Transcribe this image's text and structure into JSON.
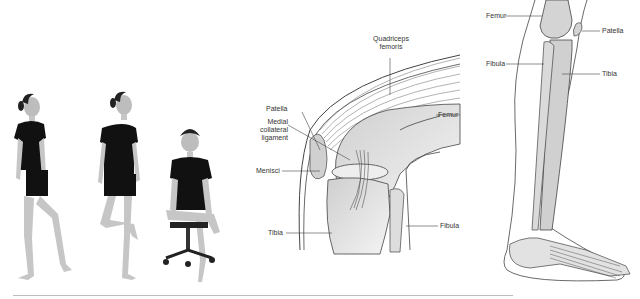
{
  "figure": {
    "panels": [
      {
        "id": "exercise-photos",
        "description": "Three photos of a girl performing knee-flexion positions",
        "poses": [
          "standing-leg-raised-forward",
          "standing-knee-bent-back",
          "seated-on-chair-leg-crossed"
        ]
      },
      {
        "id": "knee-anatomy",
        "labels": {
          "quadriceps": "Quadriceps\nfemoris",
          "quadriceps_line1": "Quadriceps",
          "quadriceps_line2": "femoris",
          "patella": "Patella",
          "medial_line1": "Medial",
          "medial_line2": "collateral",
          "medial_line3": "ligament",
          "femur": "Femur",
          "menisci": "Menisci",
          "tibia": "Tibia",
          "fibula": "Fibula"
        }
      },
      {
        "id": "leg-skeleton",
        "labels": {
          "femur": "Femur",
          "patella": "Patella",
          "fibula": "Fibula",
          "tibia": "Tibia"
        }
      }
    ],
    "colors": {
      "bone_fill": "#d9d9d9",
      "line": "#444444",
      "label_text": "#333333",
      "shirt": "#111111",
      "skin": "#c8c8c8",
      "rule": "#bcbcbc"
    }
  }
}
